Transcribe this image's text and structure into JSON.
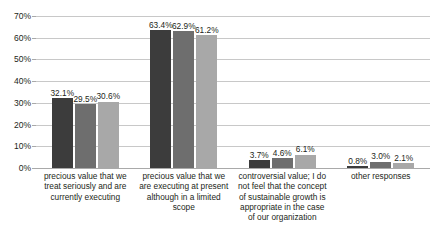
{
  "title_sliver": "............................",
  "chart_data": {
    "type": "bar",
    "title": "",
    "xlabel": "",
    "ylabel": "",
    "ylim": [
      0,
      70
    ],
    "ytick_values": [
      0,
      10,
      20,
      30,
      40,
      50,
      60,
      70
    ],
    "ytick_labels": [
      "0%",
      "10%",
      "20%",
      "30%",
      "40%",
      "50%",
      "60%",
      "70%"
    ],
    "grid": true,
    "legend": "none",
    "categories": [
      "precious value that we treat seriously and are currently executing",
      "precious value that we are executing at present although in a limited scope",
      "controversial value; I do not feel that the concept of sustainable growth is appropriate in the case of our organization",
      "other responses"
    ],
    "category_lines": [
      [
        "precious value that we treat",
        "seriously and are currently",
        "executing"
      ],
      [
        "precious value that we",
        "are executing at present",
        "although in a limited scope"
      ],
      [
        "controversial value; I do not",
        "feel that the concept of",
        "sustainable growth is",
        "appropriate in the case of",
        "our organization"
      ],
      [
        "other responses"
      ]
    ],
    "series": [
      {
        "name": "series-1",
        "color": "#3c3c3c",
        "values": [
          32.1,
          63.4,
          3.7,
          0.8
        ],
        "labels": [
          "32.1%",
          "63.4%",
          "3.7%",
          "0.8%"
        ]
      },
      {
        "name": "series-2",
        "color": "#6e6e6e",
        "values": [
          29.5,
          62.9,
          4.6,
          3.0
        ],
        "labels": [
          "29.5%",
          "62.9%",
          "4.6%",
          "3.0%"
        ]
      },
      {
        "name": "series-3",
        "color": "#a8a8a8",
        "values": [
          30.6,
          61.2,
          6.1,
          2.1
        ],
        "labels": [
          "30.6%",
          "61.2%",
          "6.1%",
          "2.1%"
        ]
      }
    ]
  }
}
